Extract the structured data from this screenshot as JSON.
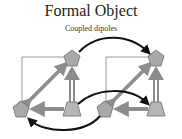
{
  "title": "Formal Object",
  "subtitle": "Coupled dipoles",
  "colors": {
    "frame": "#9a9a9a",
    "gray_arrow": "#8c8c8c",
    "node_fill": "#a9a9a9",
    "node_stroke": "#6e6e6e",
    "coupling_arrow": "#111111"
  },
  "diagram": {
    "dipoles": [
      {
        "name": "left-dipole",
        "nodes": [
          {
            "id": "L-top",
            "shape": "pentagon",
            "x": 72,
            "y": 58
          },
          {
            "id": "L-bottom-left",
            "shape": "pentagon",
            "x": 21,
            "y": 109
          },
          {
            "id": "L-bottom-right",
            "shape": "trapezoid",
            "x": 72,
            "y": 109
          }
        ]
      },
      {
        "name": "right-dipole",
        "nodes": [
          {
            "id": "R-top",
            "shape": "pentagon",
            "x": 156,
            "y": 58
          },
          {
            "id": "R-bottom-left",
            "shape": "pentagon",
            "x": 105,
            "y": 109
          },
          {
            "id": "R-bottom-right",
            "shape": "trapezoid",
            "x": 156,
            "y": 109
          }
        ]
      }
    ],
    "couplings": [
      {
        "from": "L-top",
        "to": "R-top",
        "style": "curved-arc-above"
      },
      {
        "from": "L-bottom-right",
        "to": "R-bottom-right",
        "style": "curved-arc-above"
      },
      {
        "from": "R-bottom-left",
        "to": "L-bottom-left",
        "style": "curved-arc-below"
      }
    ]
  }
}
